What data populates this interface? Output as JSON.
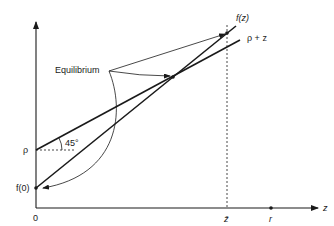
{
  "diagram": {
    "type": "economics fixed-point diagram",
    "labels": {
      "equilibrium": "Equilibrium",
      "fz": "f(z)",
      "rho_plus_z": "ρ + z",
      "rho": "ρ",
      "f0": "f(0)",
      "angle": "45°",
      "origin": "0",
      "zbar": "z̄",
      "r": "r",
      "z_axis": "z"
    },
    "colors": {
      "line": "#1a1a1a",
      "background": "#ffffff"
    }
  }
}
